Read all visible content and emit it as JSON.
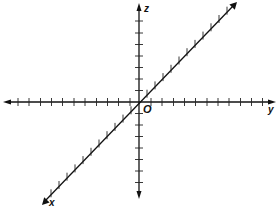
{
  "diagram": {
    "title": "",
    "type": "3D coordinate axes",
    "axes": {
      "x": {
        "label": "x",
        "direction": "toward viewer (diagonal, lower-left)",
        "ticks_positive": 11,
        "ticks_negative": 11
      },
      "y": {
        "label": "y",
        "direction": "horizontal, right",
        "ticks_positive": 11,
        "ticks_negative": 11
      },
      "z": {
        "label": "z",
        "direction": "vertical, up",
        "ticks_positive": 7,
        "ticks_negative": 7
      }
    },
    "origin": {
      "label": "O"
    },
    "colors": {
      "lines": "#111111",
      "background": "#ffffff"
    }
  }
}
